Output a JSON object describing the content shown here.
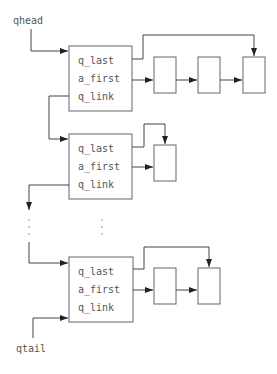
{
  "labels": {
    "qhead": "qhead",
    "qtail": "qtail"
  },
  "queues": [
    {
      "fields": [
        "q_last",
        "a_first",
        "q_link"
      ],
      "element_count": 3
    },
    {
      "fields": [
        "q_last",
        "a_first",
        "q_link"
      ],
      "element_count": 1
    },
    {
      "fields": [
        "q_last",
        "a_first",
        "q_link"
      ],
      "element_count": 2
    }
  ],
  "colors": {
    "stroke": "#444444",
    "box_stroke": "#666666",
    "text": "#555555"
  }
}
